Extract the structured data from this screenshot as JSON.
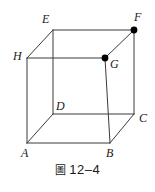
{
  "figure": {
    "type": "cube-diagram",
    "background_color": "#ffffff",
    "line_color": "#3a3a3a",
    "marked_point_color": "#000000",
    "vertices": [
      {
        "id": "A",
        "label": "A",
        "x": 27,
        "y": 143,
        "label_x": 21,
        "label_y": 147,
        "marked": false
      },
      {
        "id": "B",
        "label": "B",
        "x": 110,
        "y": 143,
        "label_x": 106,
        "label_y": 147,
        "marked": false
      },
      {
        "id": "C",
        "label": "C",
        "x": 134,
        "y": 114,
        "label_x": 139,
        "label_y": 112,
        "marked": false
      },
      {
        "id": "D",
        "label": "D",
        "x": 53,
        "y": 114,
        "label_x": 56,
        "label_y": 100,
        "marked": false
      },
      {
        "id": "E",
        "label": "E",
        "x": 53,
        "y": 30,
        "label_x": 42,
        "label_y": 13,
        "marked": false
      },
      {
        "id": "F",
        "label": "F",
        "x": 134,
        "y": 30,
        "label_x": 134,
        "label_y": 11,
        "marked": true
      },
      {
        "id": "G",
        "label": "G",
        "x": 105,
        "y": 58,
        "label_x": 110,
        "label_y": 58,
        "marked": true
      },
      {
        "id": "H",
        "label": "H",
        "x": 27,
        "y": 58,
        "label_x": 13,
        "label_y": 50,
        "marked": false
      }
    ],
    "edges": [
      {
        "from": "A",
        "to": "B"
      },
      {
        "from": "B",
        "to": "C"
      },
      {
        "from": "C",
        "to": "D"
      },
      {
        "from": "D",
        "to": "A"
      },
      {
        "from": "E",
        "to": "F"
      },
      {
        "from": "F",
        "to": "G"
      },
      {
        "from": "G",
        "to": "H"
      },
      {
        "from": "H",
        "to": "E"
      },
      {
        "from": "A",
        "to": "H"
      },
      {
        "from": "B",
        "to": "G"
      },
      {
        "from": "C",
        "to": "F"
      },
      {
        "from": "D",
        "to": "E"
      }
    ]
  },
  "caption": {
    "figure_word": "圖",
    "number": "12–4",
    "full": "圖 12–4"
  }
}
